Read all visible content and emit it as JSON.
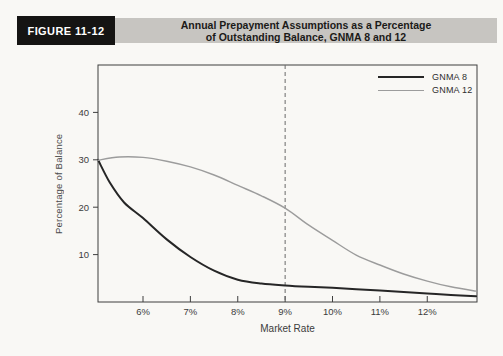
{
  "header": {
    "figure_label": "FIGURE 11-12",
    "title_line1": "Annual Prepayment Assumptions as a Percentage",
    "title_line2": "of Outstanding Balance, GNMA 8 and 12"
  },
  "colors": {
    "figure_box_bg": "#151413",
    "figure_box_text": "#ffffff",
    "title_bar_bg": "#c7c5c1",
    "axis": "#3f3f3f",
    "tick_text": "#3c3c3c",
    "reference_line": "#6a6a6a",
    "gnma8_line": "#262626",
    "gnma12_line": "#9c9c9c"
  },
  "chart_data": {
    "type": "line",
    "title": "Annual Prepayment Assumptions as a Percentage of Outstanding Balance, GNMA 8 and 12",
    "xlabel": "Market Rate",
    "ylabel": "Percentage of Balance",
    "xlim": [
      5.05,
      13.05
    ],
    "ylim": [
      0,
      50
    ],
    "grid": false,
    "legend_position": "top-right",
    "x_ticks": [
      {
        "value": 6,
        "label": "6%"
      },
      {
        "value": 7,
        "label": "7%"
      },
      {
        "value": 8,
        "label": "8%"
      },
      {
        "value": 9,
        "label": "9%"
      },
      {
        "value": 10,
        "label": "10%"
      },
      {
        "value": 11,
        "label": "11%"
      },
      {
        "value": 12,
        "label": "12%"
      }
    ],
    "y_ticks": [
      {
        "value": 10,
        "label": "10"
      },
      {
        "value": 20,
        "label": "20"
      },
      {
        "value": 30,
        "label": "30"
      },
      {
        "value": 40,
        "label": "40"
      }
    ],
    "reference_line": {
      "x": 9,
      "style": "dashed"
    },
    "series": [
      {
        "name": "GNMA 8",
        "color": "#262626",
        "width": 2,
        "points": [
          [
            5.05,
            30.0
          ],
          [
            5.3,
            25.2
          ],
          [
            5.6,
            21.0
          ],
          [
            6.0,
            17.7
          ],
          [
            6.5,
            13.2
          ],
          [
            7.0,
            9.5
          ],
          [
            7.5,
            6.6
          ],
          [
            8.0,
            4.7
          ],
          [
            8.5,
            3.9
          ],
          [
            9.0,
            3.5
          ],
          [
            9.5,
            3.2
          ],
          [
            10.0,
            3.0
          ],
          [
            10.5,
            2.7
          ],
          [
            11.0,
            2.4
          ],
          [
            11.5,
            2.1
          ],
          [
            12.0,
            1.8
          ],
          [
            12.5,
            1.5
          ],
          [
            13.03,
            1.2
          ]
        ]
      },
      {
        "name": "GNMA 12",
        "color": "#9c9c9c",
        "width": 1.4,
        "points": [
          [
            5.05,
            29.9
          ],
          [
            5.5,
            30.6
          ],
          [
            6.0,
            30.5
          ],
          [
            6.5,
            29.7
          ],
          [
            7.0,
            28.5
          ],
          [
            7.5,
            26.8
          ],
          [
            8.0,
            24.6
          ],
          [
            8.5,
            22.4
          ],
          [
            9.0,
            19.8
          ],
          [
            9.5,
            16.2
          ],
          [
            10.0,
            13.0
          ],
          [
            10.5,
            9.9
          ],
          [
            11.0,
            7.8
          ],
          [
            11.5,
            5.9
          ],
          [
            12.0,
            4.4
          ],
          [
            12.5,
            3.2
          ],
          [
            13.03,
            2.3
          ]
        ]
      }
    ]
  }
}
